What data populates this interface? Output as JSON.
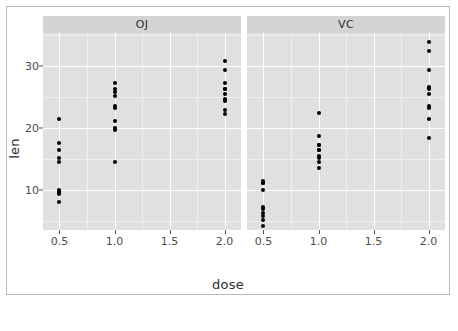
{
  "chart_data": {
    "type": "scatter",
    "title": "",
    "xlabel": "dose",
    "ylabel": "len",
    "xlim": [
      0.35,
      2.15
    ],
    "ylim": [
      3.6,
      35.4
    ],
    "grid": true,
    "legend": "none",
    "facet_variable": "supp",
    "facets": [
      {
        "label": "OJ",
        "x": [
          0.5,
          0.5,
          0.5,
          0.5,
          0.5,
          0.5,
          0.5,
          0.5,
          0.5,
          0.5,
          1.0,
          1.0,
          1.0,
          1.0,
          1.0,
          1.0,
          1.0,
          1.0,
          1.0,
          1.0,
          2.0,
          2.0,
          2.0,
          2.0,
          2.0,
          2.0,
          2.0,
          2.0,
          2.0,
          2.0
        ],
        "y": [
          15.2,
          21.5,
          17.6,
          9.7,
          14.5,
          10.0,
          8.2,
          9.4,
          16.5,
          9.7,
          19.7,
          23.3,
          23.6,
          26.4,
          20.0,
          25.2,
          25.8,
          21.2,
          14.5,
          27.3,
          25.5,
          26.4,
          22.4,
          24.5,
          24.8,
          30.9,
          26.4,
          27.3,
          29.4,
          23.0
        ]
      },
      {
        "label": "VC",
        "x": [
          0.5,
          0.5,
          0.5,
          0.5,
          0.5,
          0.5,
          0.5,
          0.5,
          0.5,
          0.5,
          1.0,
          1.0,
          1.0,
          1.0,
          1.0,
          1.0,
          1.0,
          1.0,
          1.0,
          1.0,
          2.0,
          2.0,
          2.0,
          2.0,
          2.0,
          2.0,
          2.0,
          2.0,
          2.0,
          2.0
        ],
        "y": [
          4.2,
          11.5,
          7.3,
          5.8,
          6.4,
          10.0,
          11.2,
          11.2,
          5.2,
          7.0,
          16.5,
          16.5,
          15.2,
          17.3,
          22.5,
          17.3,
          13.6,
          14.5,
          18.8,
          15.5,
          23.6,
          18.5,
          33.9,
          25.5,
          26.4,
          32.5,
          26.7,
          21.5,
          23.3,
          29.5
        ]
      }
    ],
    "x_ticks": [
      0.5,
      1.0,
      1.5,
      2.0
    ],
    "x_tick_labels": [
      "0.5",
      "1.0",
      "1.5",
      "2.0"
    ],
    "y_ticks": [
      10,
      20,
      30
    ],
    "y_tick_labels": [
      "10",
      "20",
      "30"
    ],
    "x_minor_ticks": [
      0.75,
      1.25,
      1.75
    ],
    "y_minor_ticks": [
      5,
      15,
      25,
      35
    ],
    "colors": {
      "panel_background": "#e0e0e0",
      "strip_background": "#d4d4d4",
      "major_gridline": "#ffffff",
      "minor_gridline": "#f0f0f0",
      "point": "#000000",
      "text": "#4d4d4d",
      "figure_background": "#ffffff",
      "figure_border": "#b9b9b9"
    }
  }
}
